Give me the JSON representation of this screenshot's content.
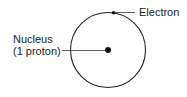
{
  "diagram": {
    "labels": {
      "electron": "Electron",
      "nucleus_line1": "Nucleus",
      "nucleus_line2": "(1 proton)"
    },
    "colors": {
      "stroke": "#222222",
      "background": "#ffffff"
    }
  }
}
